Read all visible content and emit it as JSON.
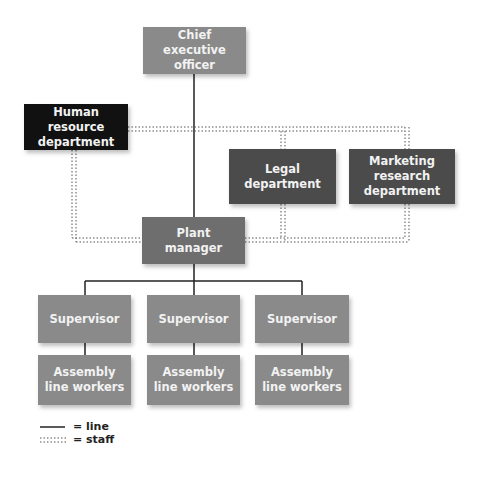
{
  "chart_title": "",
  "nodes": {
    "ceo": "Chief executive officer",
    "hr": "Human resource department",
    "legal": "Legal department",
    "marketing": "Marketing research department",
    "plant_manager": "Plant manager",
    "supervisors": [
      "Supervisor",
      "Supervisor",
      "Supervisor"
    ],
    "workers": [
      "Assembly line workers",
      "Assembly line workers",
      "Assembly line workers"
    ]
  },
  "legend": {
    "line_label": "= line",
    "staff_label": "= staff"
  },
  "colors": {
    "line": "#222222",
    "staff": "#555555",
    "ceo_box": "#8a8a8a",
    "hr_box": "#111111",
    "dept_box": "#4b4b4b",
    "plant_box": "#6e6e6e",
    "unit_box": "#8a8a8a"
  }
}
